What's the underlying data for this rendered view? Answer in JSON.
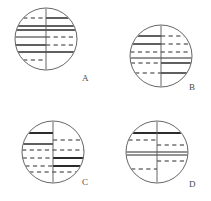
{
  "figure": {
    "type": "geometry-diagram",
    "background": "#ffffff",
    "stroke_color": "#2b2b2b",
    "circle_outline_color": "#555555",
    "panel_count": 4
  },
  "panels": [
    {
      "id": "A",
      "label": "A",
      "label_x": 82,
      "label_y": 74,
      "cx": 46,
      "cy": 39,
      "r": 31,
      "divider": "vertical",
      "lines": [
        {
          "y": -21,
          "side": "left",
          "style": "dashed",
          "weight": 1
        },
        {
          "y": -21,
          "side": "right",
          "style": "solid",
          "weight": 1.6
        },
        {
          "y": -13,
          "side": "both",
          "style": "solid",
          "weight": 1.6
        },
        {
          "y": -9,
          "side": "both",
          "style": "solid",
          "weight": 1.6
        },
        {
          "y": -2,
          "side": "left",
          "style": "solid",
          "weight": 1.0
        },
        {
          "y": -2,
          "side": "right",
          "style": "dashed",
          "weight": 1
        },
        {
          "y": 6,
          "side": "left",
          "style": "solid",
          "weight": 1.6
        },
        {
          "y": 6,
          "side": "right",
          "style": "dashed",
          "weight": 1
        },
        {
          "y": 13,
          "side": "both",
          "style": "solid",
          "weight": 1.6
        },
        {
          "y": 21,
          "side": "left",
          "style": "dashed",
          "weight": 1
        }
      ]
    },
    {
      "id": "B",
      "label": "B",
      "label_x": 189,
      "label_y": 83,
      "cx": 161,
      "cy": 56,
      "r": 31,
      "divider": "vertical",
      "lines": [
        {
          "y": -20,
          "side": "left",
          "style": "solid",
          "weight": 1.6
        },
        {
          "y": -20,
          "side": "right",
          "style": "dashed",
          "weight": 1
        },
        {
          "y": -12,
          "side": "left",
          "style": "solid",
          "weight": 1.6
        },
        {
          "y": -12,
          "side": "right",
          "style": "dashed",
          "weight": 1
        },
        {
          "y": -4,
          "side": "both",
          "style": "dashed",
          "weight": 1
        },
        {
          "y": 2,
          "side": "left",
          "style": "solid",
          "weight": 1.0
        },
        {
          "y": 2,
          "side": "right",
          "style": "solid",
          "weight": 1.0
        },
        {
          "y": 7,
          "side": "left",
          "style": "dashed",
          "weight": 1
        },
        {
          "y": 7,
          "side": "right",
          "style": "solid",
          "weight": 1.6
        },
        {
          "y": 17,
          "side": "left",
          "style": "dashed",
          "weight": 1
        },
        {
          "y": 17,
          "side": "right",
          "style": "solid",
          "weight": 1.6
        }
      ]
    },
    {
      "id": "C",
      "label": "C",
      "label_x": 82,
      "label_y": 178,
      "cx": 53,
      "cy": 152,
      "r": 31,
      "divider": "vertical",
      "lines": [
        {
          "y": -19,
          "side": "left",
          "style": "solid",
          "weight": 1.8
        },
        {
          "y": -12,
          "side": "right",
          "style": "dashed",
          "weight": 1
        },
        {
          "y": -8,
          "side": "left",
          "style": "solid",
          "weight": 1.6
        },
        {
          "y": -2,
          "side": "both",
          "style": "dashed",
          "weight": 1
        },
        {
          "y": 6,
          "side": "left",
          "style": "dashed",
          "weight": 1
        },
        {
          "y": 6,
          "side": "right",
          "style": "solid",
          "weight": 1.8
        },
        {
          "y": 14,
          "side": "left",
          "style": "dashed",
          "weight": 1
        },
        {
          "y": 14,
          "side": "right",
          "style": "solid",
          "weight": 1.8
        },
        {
          "y": 20,
          "side": "both",
          "style": "dashed",
          "weight": 1
        }
      ]
    },
    {
      "id": "D",
      "label": "D",
      "label_x": 189,
      "label_y": 180,
      "cx": 157,
      "cy": 152,
      "r": 31,
      "divider": "vertical",
      "lines": [
        {
          "y": -19,
          "side": "both",
          "style": "solid",
          "weight": 1.8
        },
        {
          "y": -12,
          "side": "left",
          "style": "dashed",
          "weight": 1
        },
        {
          "y": -7,
          "side": "right",
          "style": "dashed",
          "weight": 1
        },
        {
          "y": 0,
          "side": "both",
          "style": "solid",
          "weight": 1.2
        },
        {
          "y": 3,
          "side": "both",
          "style": "solid",
          "weight": 1.2
        },
        {
          "y": 9,
          "side": "right",
          "style": "dashed",
          "weight": 1
        },
        {
          "y": 17,
          "side": "left",
          "style": "dashed",
          "weight": 1
        }
      ]
    }
  ]
}
